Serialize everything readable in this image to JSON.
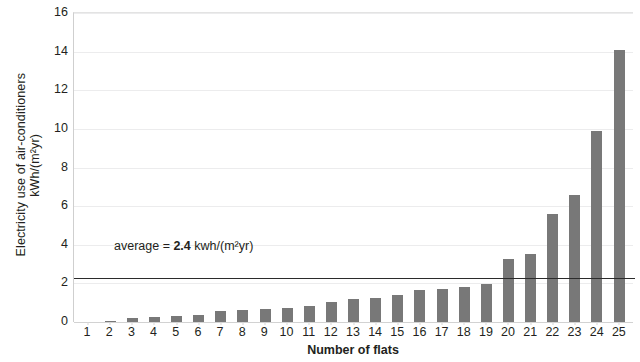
{
  "chart_data": {
    "type": "bar",
    "title": "",
    "xlabel": "Number of flats",
    "ylabel_line1": "Electricity use of air-conditioners",
    "ylabel_line2": "kWh/(m²yr)",
    "categories": [
      "1",
      "2",
      "3",
      "4",
      "5",
      "6",
      "7",
      "8",
      "9",
      "10",
      "11",
      "12",
      "13",
      "14",
      "15",
      "16",
      "17",
      "18",
      "19",
      "20",
      "21",
      "22",
      "23",
      "24",
      "25"
    ],
    "values": [
      0.0,
      0.07,
      0.22,
      0.26,
      0.3,
      0.36,
      0.55,
      0.62,
      0.65,
      0.72,
      0.85,
      1.05,
      1.2,
      1.25,
      1.4,
      1.65,
      1.7,
      1.8,
      1.95,
      3.25,
      3.5,
      5.6,
      6.6,
      9.9,
      14.1
    ],
    "ylim": [
      0,
      16
    ],
    "yticks": [
      0,
      2,
      4,
      6,
      8,
      10,
      12,
      14,
      16
    ],
    "ytick_labels": [
      "0",
      "2",
      "4",
      "6",
      "8",
      "10",
      "12",
      "14",
      "16"
    ],
    "grid": true,
    "legend": "none",
    "bar_color": "#787878",
    "gridline_color": "#ececed",
    "text_color": "#231f20",
    "annotations": [
      {
        "name": "average-annotation",
        "prefix": "average = ",
        "value": "2.4",
        "suffix": " kwh/(m²yr)",
        "y": 2.4
      }
    ],
    "reference_lines": [
      {
        "name": "average-line",
        "value": 2.3,
        "color": "#2b2b2b"
      }
    ]
  }
}
